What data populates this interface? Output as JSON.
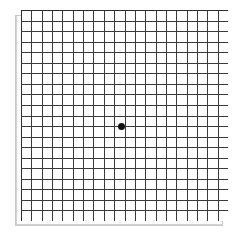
{
  "chart_data": {
    "type": "grid",
    "columns": 20,
    "rows": 20,
    "cell_size_px": 10.35,
    "grid_left_px": 21,
    "grid_top_px": 10,
    "grid_width_px": 207,
    "grid_height_px": 211,
    "line_color": "#3a3a3a",
    "line_width_px": 1,
    "border_color": "#2e2e2e",
    "shadow_color": "#c9c9c9",
    "background_color": "#ffffff",
    "fixation_dot": {
      "label": "center-fixation-dot",
      "color": "#111111",
      "diameter_px": 7,
      "center_x_px": 121.5,
      "center_y_px": 126.5,
      "grid_column": 10,
      "grid_row": 10
    },
    "xlabel": "",
    "ylabel": "",
    "grid": true,
    "legend": false
  }
}
